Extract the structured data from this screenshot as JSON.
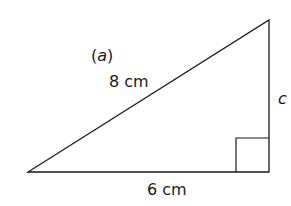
{
  "diagram": {
    "part_label": "(a)",
    "part_letter": "a",
    "hypotenuse_label": "8 cm",
    "base_label": "6 cm",
    "vertical_side_label": "c",
    "triangle": {
      "vertices": [
        [
          28,
          172
        ],
        [
          269,
          172
        ],
        [
          269,
          20
        ]
      ],
      "right_angle_at": [
        269,
        172
      ],
      "stroke_color": "#1a1a1a"
    }
  }
}
